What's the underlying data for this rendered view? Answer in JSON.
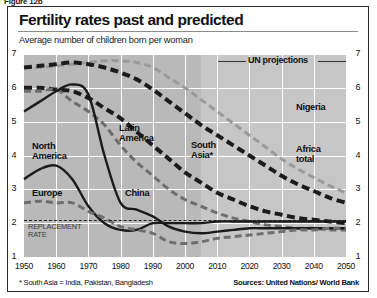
{
  "figure_label": "Figure 12b",
  "title": "Fertility rates past and predicted",
  "subtitle": "Average number of children born per woman",
  "legend": {
    "un_projections": "UN projections"
  },
  "annotations": {
    "replacement_rate_line1": "REPLACEMENT",
    "replacement_rate_line2": "RATE"
  },
  "footnote": "* South Asia = India, Pakistan, Bangladesh",
  "sources": "Sources: United Nations/ World Bank",
  "series_labels": {
    "north_america": "North America",
    "europe": "Europe",
    "china": "China",
    "latin_america": "Latin America",
    "south_asia": "South Asia*",
    "nigeria": "Nigeria",
    "africa_total": "Africa total"
  },
  "colors": {
    "plot_background": "#b9b9b9",
    "projection_background": "#c6c6c6",
    "gridline": "#ffffff",
    "dark_line": "#1b1b1b",
    "mid_grey_line": "#6e6e6e",
    "light_grey_line": "#9a9a9a",
    "frame": "#2b2b2b",
    "page": "#ffffff"
  },
  "chart_data": {
    "type": "line",
    "title": "Fertility rates past and predicted",
    "subtitle": "Average number of children born per woman",
    "xlabel": "",
    "ylabel": "Average number of children born per woman",
    "xlim": [
      1950,
      2050
    ],
    "ylim": [
      1,
      7
    ],
    "grid": true,
    "legend_position": "top-right",
    "xticks": [
      1950,
      1960,
      1970,
      1980,
      1990,
      2000,
      2010,
      2020,
      2030,
      2040,
      2050
    ],
    "yticks": [
      1,
      2,
      3,
      4,
      5,
      6,
      7
    ],
    "reference_lines": [
      {
        "label": "REPLACEMENT RATE",
        "y": 2.1,
        "style": "dashed"
      }
    ],
    "projection_start": 2005,
    "x": [
      1950,
      1955,
      1960,
      1965,
      1970,
      1975,
      1980,
      1985,
      1990,
      1995,
      2000,
      2005,
      2010,
      2015,
      2020,
      2025,
      2030,
      2035,
      2040,
      2045,
      2050
    ],
    "series": [
      {
        "name": "Nigeria",
        "style": "dashed",
        "color": "#9a9a9a",
        "values": [
          6.6,
          6.6,
          6.65,
          6.7,
          6.75,
          6.8,
          6.8,
          6.75,
          6.6,
          6.3,
          6.0,
          5.65,
          5.3,
          4.95,
          4.6,
          4.25,
          3.9,
          3.6,
          3.35,
          3.1,
          2.9
        ]
      },
      {
        "name": "Africa total",
        "style": "dashed-bold",
        "color": "#1b1b1b",
        "values": [
          6.6,
          6.65,
          6.7,
          6.75,
          6.7,
          6.6,
          6.45,
          6.25,
          5.95,
          5.6,
          5.25,
          4.9,
          4.6,
          4.3,
          4.0,
          3.7,
          3.4,
          3.15,
          2.95,
          2.75,
          2.6
        ]
      },
      {
        "name": "South Asia*",
        "style": "dashed-bold",
        "color": "#1b1b1b",
        "values": [
          6.0,
          6.0,
          5.95,
          5.9,
          5.7,
          5.4,
          5.1,
          4.7,
          4.3,
          3.9,
          3.5,
          3.2,
          2.9,
          2.7,
          2.5,
          2.35,
          2.25,
          2.15,
          2.1,
          2.05,
          2.0
        ]
      },
      {
        "name": "Latin America",
        "style": "dashed",
        "color": "#6e6e6e",
        "values": [
          5.9,
          5.9,
          5.95,
          5.6,
          5.3,
          4.9,
          4.3,
          3.8,
          3.4,
          3.0,
          2.7,
          2.5,
          2.3,
          2.15,
          2.05,
          1.95,
          1.9,
          1.85,
          1.85,
          1.8,
          1.8
        ]
      },
      {
        "name": "China",
        "style": "solid",
        "color": "#1b1b1b",
        "values": [
          5.3,
          5.6,
          5.9,
          6.1,
          5.8,
          4.0,
          2.6,
          2.4,
          2.2,
          1.9,
          1.75,
          1.7,
          1.75,
          1.8,
          1.85,
          1.85,
          1.85,
          1.85,
          1.85,
          1.85,
          1.85
        ]
      },
      {
        "name": "North America",
        "style": "solid",
        "color": "#1b1b1b",
        "values": [
          3.3,
          3.6,
          3.7,
          3.3,
          2.5,
          2.0,
          1.8,
          1.8,
          2.0,
          2.0,
          2.0,
          2.0,
          2.05,
          2.05,
          2.05,
          2.05,
          2.05,
          2.05,
          2.05,
          2.05,
          2.05
        ]
      },
      {
        "name": "Europe",
        "style": "dashed",
        "color": "#6e6e6e",
        "values": [
          2.6,
          2.65,
          2.6,
          2.6,
          2.35,
          2.15,
          1.9,
          1.8,
          1.7,
          1.45,
          1.4,
          1.45,
          1.55,
          1.6,
          1.65,
          1.7,
          1.75,
          1.8,
          1.8,
          1.85,
          1.85
        ]
      }
    ]
  }
}
